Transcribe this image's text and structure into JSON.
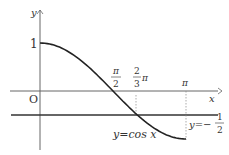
{
  "diagram": {
    "y_axis_label": "y",
    "x_axis_label": "x",
    "origin_label": "O",
    "y_tick_1": "1",
    "x_tick_pi_half": {
      "num": "π",
      "den": "2"
    },
    "x_tick_two_thirds_pi": {
      "num": "2",
      "den": "3",
      "suffix": "π"
    },
    "x_tick_pi": "π",
    "curve_label": "y=cos x",
    "line_label": {
      "prefix": "y=−",
      "num": "1",
      "den": "2"
    }
  }
}
